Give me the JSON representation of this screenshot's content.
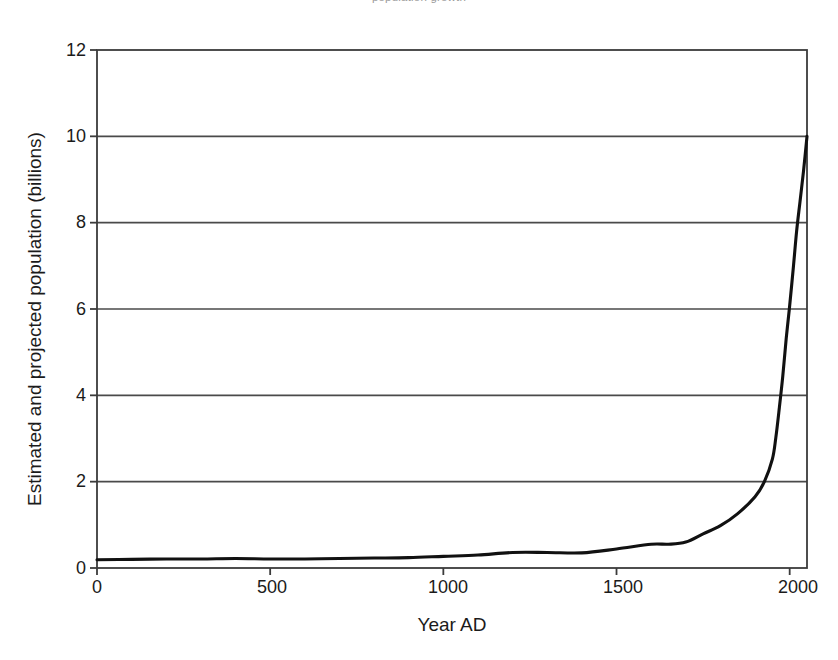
{
  "figure": {
    "top_caption_sliver": "population growth",
    "background_color": "#ffffff",
    "line_color": "#111111",
    "axis_color": "#3b3b3b",
    "grid_color": "#4a4a4a"
  },
  "chart_data": {
    "type": "line",
    "title": "",
    "xlabel": "Year AD",
    "ylabel": "Estimated and projected population (billions)",
    "xlim": [
      0,
      2050
    ],
    "ylim": [
      0,
      12
    ],
    "xticks": [
      "0",
      "500",
      "1000",
      "1500",
      "2000"
    ],
    "xtick_values": [
      0,
      500,
      1000,
      1500,
      2000
    ],
    "yticks": [
      "0",
      "2",
      "4",
      "6",
      "8",
      "10",
      "12"
    ],
    "ytick_values": [
      0,
      2,
      4,
      6,
      8,
      10,
      12
    ],
    "grid": "horizontal",
    "legend": "none",
    "series": [
      {
        "name": "Estimated and projected world population",
        "x": [
          0,
          100,
          200,
          300,
          400,
          500,
          600,
          700,
          800,
          900,
          1000,
          1100,
          1200,
          1300,
          1400,
          1500,
          1600,
          1650,
          1700,
          1750,
          1800,
          1850,
          1900,
          1927,
          1950,
          1960,
          1970,
          1980,
          1990,
          1999,
          2011,
          2020,
          2030,
          2040,
          2050
        ],
        "y": [
          0.19,
          0.2,
          0.21,
          0.21,
          0.22,
          0.21,
          0.21,
          0.22,
          0.23,
          0.24,
          0.27,
          0.3,
          0.36,
          0.36,
          0.35,
          0.44,
          0.55,
          0.55,
          0.6,
          0.79,
          0.98,
          1.26,
          1.65,
          2.0,
          2.52,
          3.02,
          3.7,
          4.44,
          5.32,
          6.0,
          7.0,
          7.8,
          8.5,
          9.2,
          10.0
        ]
      }
    ]
  }
}
